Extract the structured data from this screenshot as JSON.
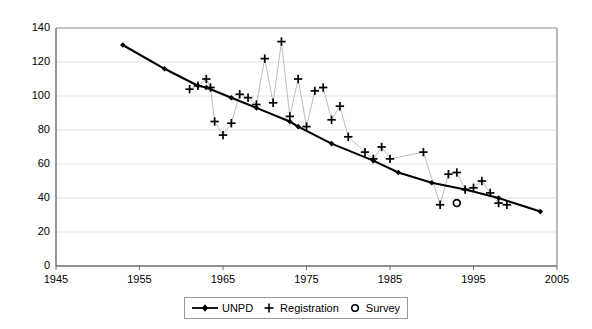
{
  "chart_data": {
    "type": "scatter",
    "title": "",
    "xlabel": "",
    "ylabel": "",
    "xlim": [
      1945,
      2005
    ],
    "ylim": [
      0,
      140
    ],
    "xticks": [
      1945,
      1955,
      1965,
      1975,
      1985,
      1995,
      2005
    ],
    "yticks": [
      0,
      20,
      40,
      60,
      80,
      100,
      120,
      140
    ],
    "grid": "horizontal",
    "legend_position": "bottom-center",
    "series": [
      {
        "name": "UNPD",
        "marker": "filled-diamond",
        "line": "solid-thick",
        "color": "#000000",
        "points": [
          [
            1953,
            130
          ],
          [
            1958,
            116
          ],
          [
            1962,
            106
          ],
          [
            1963,
            105
          ],
          [
            1966,
            99
          ],
          [
            1969,
            93
          ],
          [
            1973,
            85
          ],
          [
            1974,
            82
          ],
          [
            1978,
            72
          ],
          [
            1983,
            62
          ],
          [
            1986,
            55
          ],
          [
            1990,
            49
          ],
          [
            1994,
            45
          ],
          [
            1998,
            40
          ],
          [
            2003,
            32
          ]
        ]
      },
      {
        "name": "Registration",
        "marker": "plus",
        "line": "thin-connector",
        "color": "#000000",
        "points": [
          [
            1961,
            104
          ],
          [
            1962,
            106
          ],
          [
            1963,
            110
          ],
          [
            1963.5,
            105
          ],
          [
            1964,
            85
          ],
          [
            1965,
            77
          ],
          [
            1966,
            84
          ],
          [
            1967,
            101
          ],
          [
            1968,
            99
          ],
          [
            1969,
            95
          ],
          [
            1970,
            122
          ],
          [
            1971,
            96
          ],
          [
            1972,
            132
          ],
          [
            1973,
            88
          ],
          [
            1974,
            110
          ],
          [
            1975,
            82
          ],
          [
            1976,
            103
          ],
          [
            1977,
            105
          ],
          [
            1978,
            86
          ],
          [
            1979,
            94
          ],
          [
            1980,
            76
          ],
          [
            1982,
            67
          ],
          [
            1983,
            63
          ],
          [
            1984,
            70
          ],
          [
            1985,
            63
          ],
          [
            1989,
            67
          ],
          [
            1991,
            36
          ],
          [
            1992,
            54
          ],
          [
            1993,
            55
          ],
          [
            1994,
            45
          ],
          [
            1995,
            46
          ],
          [
            1996,
            50
          ],
          [
            1997,
            43
          ],
          [
            1998,
            37
          ],
          [
            1999,
            36
          ]
        ]
      },
      {
        "name": "Survey",
        "marker": "open-circle",
        "color": "#000000",
        "points": [
          [
            1993,
            37
          ]
        ]
      }
    ]
  },
  "legend": {
    "entries": [
      {
        "label": "UNPD",
        "marker": "line-diamond"
      },
      {
        "label": "Registration",
        "marker": "plus"
      },
      {
        "label": "Survey",
        "marker": "circle"
      }
    ]
  },
  "axis": {
    "y_labels": [
      "140",
      "120",
      "100",
      "80",
      "60",
      "40",
      "20",
      "0"
    ],
    "x_labels": [
      "1945",
      "1955",
      "1965",
      "1975",
      "1985",
      "1995",
      "2005"
    ]
  }
}
